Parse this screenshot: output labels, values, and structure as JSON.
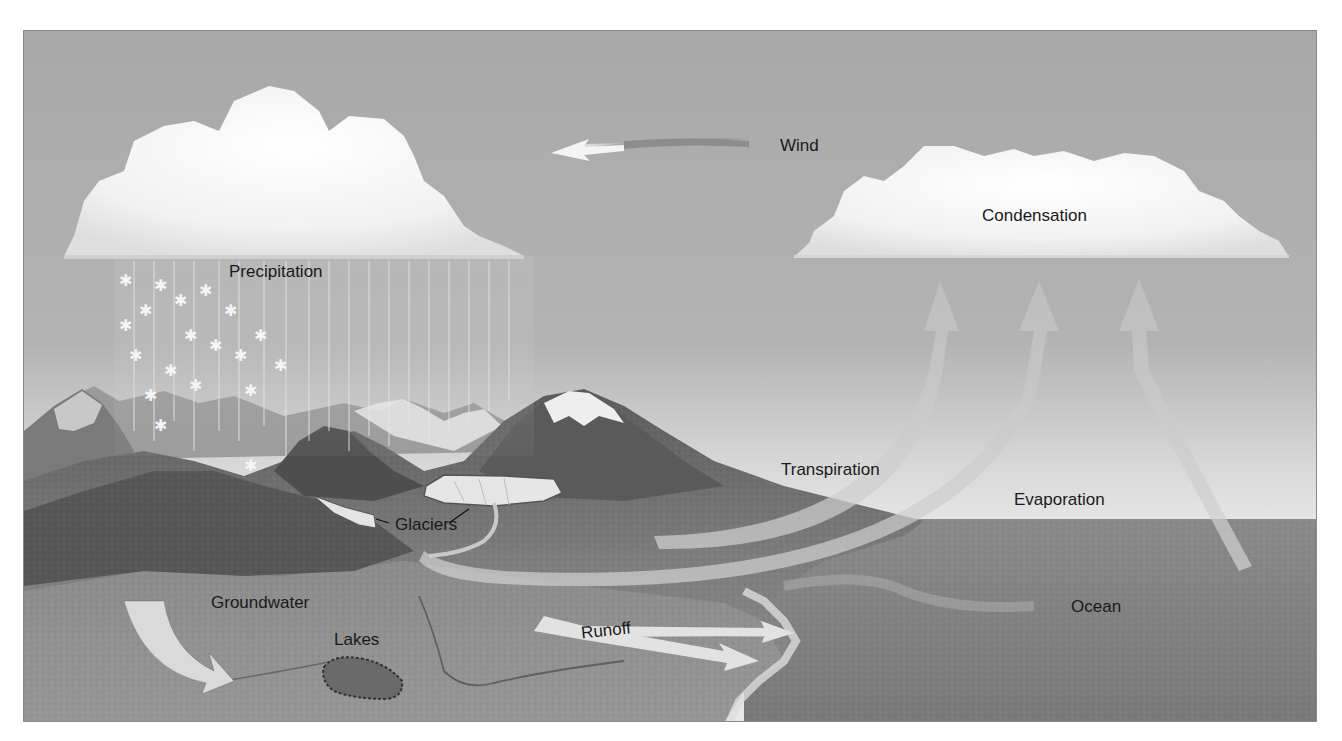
{
  "diagram": {
    "labels": {
      "wind": "Wind",
      "precipitation": "Precipitation",
      "condensation": "Condensation",
      "transpiration": "Transpiration",
      "evaporation": "Evaporation",
      "glaciers": "Glaciers",
      "groundwater": "Groundwater",
      "lakes": "Lakes",
      "runoff": "Runoff",
      "ocean": "Ocean"
    },
    "colors": {
      "sky_top": "#a9a9a9",
      "sky_horizon": "#dcdcdc",
      "ocean": "#7f7f7f",
      "land": "#6e6e6e",
      "cloud": "#f4f4f4",
      "arrow": "#d2d2d2",
      "text": "#1a1a1a"
    },
    "flows": [
      {
        "name": "wind",
        "direction": "right-to-left",
        "from": "condensation-cloud",
        "to": "precipitation-cloud"
      },
      {
        "name": "precipitation",
        "from": "cloud",
        "to": "mountains"
      },
      {
        "name": "groundwater",
        "from": "land-surface",
        "to": "underground"
      },
      {
        "name": "runoff",
        "from": "land",
        "to": "ocean"
      },
      {
        "name": "transpiration",
        "from": "vegetation",
        "to": "condensation-cloud"
      },
      {
        "name": "evaporation",
        "from": "ocean-and-river",
        "to": "condensation-cloud"
      }
    ]
  }
}
